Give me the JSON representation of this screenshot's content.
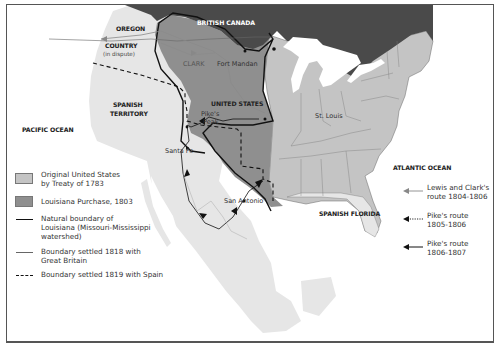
{
  "map": {
    "title": "Louisiana Purchase and Western Exploration",
    "regions": {
      "british_canada": "BRITISH CANADA",
      "oregon_country": "OREGON",
      "oregon_country_line2": "COUNTRY",
      "oregon_dispute": "(in dispute)",
      "spanish_territory": "SPANISH",
      "spanish_territory_line2": "TERRITORY",
      "united_states": "UNITED STATES",
      "spanish_florida": "SPANISH FLORIDA",
      "pacific_ocean": "PACIFIC OCEAN",
      "atlantic_ocean": "ATLANTIC OCEAN"
    },
    "places": {
      "fort_mandan": "Fort Mandan",
      "clark": "CLARK",
      "st_louis": "St. Louis",
      "pikes_peak": "Pike's",
      "pikes_peak_line2": "Peak",
      "santa_fe": "Santa Fe",
      "san_antonio": "San Antonio"
    },
    "colors": {
      "original_us": "#c4c4c4",
      "louisiana_purchase": "#8f8f8f",
      "british_canada": "#4a4a4a",
      "spanish_land": "#e6e6e6",
      "water": "#ffffff",
      "boundary": "#111111"
    }
  },
  "legend": {
    "items": [
      {
        "label": "Original United States",
        "label2": "by Treaty of 1783",
        "type": "swatch-light"
      },
      {
        "label": "Louisiana Purchase, 1803",
        "type": "swatch-dark"
      },
      {
        "label": "Natural boundary of",
        "label2": "Louisiana (Missouri-Mississippi",
        "label3": "watershed)",
        "type": "thick-line"
      },
      {
        "label": "Boundary settled 1818 with",
        "label2": "Great Britain",
        "type": "thin-line"
      },
      {
        "label": "Boundary settled 1819 with Spain",
        "type": "dashed-line"
      }
    ]
  },
  "routes_legend": {
    "items": [
      {
        "label": "Lewis and Clark's",
        "label2": "route 1804-1806",
        "type": "gray-arrow"
      },
      {
        "label": "Pike's route",
        "label2": "1805-1806",
        "type": "dotted-arrow"
      },
      {
        "label": "Pike's route",
        "label2": "1806-1807",
        "type": "black-arrow"
      }
    ]
  }
}
